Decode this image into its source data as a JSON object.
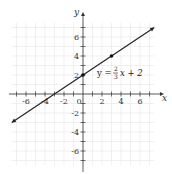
{
  "chart_data": {
    "type": "line",
    "title": "",
    "xlabel": "x",
    "ylabel": "y",
    "xlim": [
      -7.5,
      8
    ],
    "ylim": [
      -7.5,
      7.5
    ],
    "grid": true,
    "x_tick_labels": [
      "-6",
      "-4",
      "-2",
      "0",
      "2",
      "4",
      "6"
    ],
    "y_tick_labels": [
      "6",
      "4",
      "2",
      "-2",
      "-4",
      "-6"
    ],
    "series": [
      {
        "name": "y = 2/3 x + 2",
        "equation": "y = (2/3)x + 2",
        "slope": 0.6667,
        "intercept": 2,
        "x": [
          -7.5,
          7.5
        ],
        "y": [
          -3,
          7
        ],
        "arrows": "both"
      }
    ],
    "points": [
      {
        "x": 0,
        "y": 2
      },
      {
        "x": 3,
        "y": 4
      }
    ],
    "annotations": [
      {
        "text": "y = 2/3 x + 2",
        "x": 1.5,
        "y": 2.3
      }
    ]
  },
  "labels": {
    "x_axis": "x",
    "y_axis": "y",
    "origin": "0",
    "eq_lhs": "y =",
    "eq_num": "2",
    "eq_den": "3",
    "eq_rhs": "x + 2"
  }
}
